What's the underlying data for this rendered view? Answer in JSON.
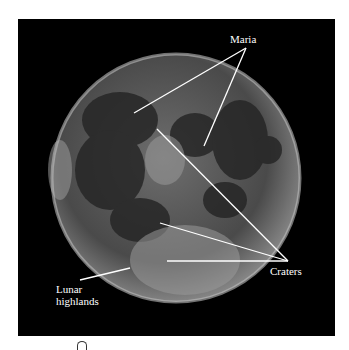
{
  "figure": {
    "labels": {
      "maria": "Maria",
      "craters": "Craters",
      "highlands_line1": "Lunar",
      "highlands_line2": "highlands"
    },
    "colors": {
      "background": "#000000",
      "label": "#ffffff",
      "page": "#ffffff"
    }
  }
}
